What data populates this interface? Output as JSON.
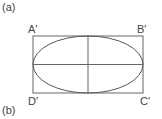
{
  "labels": {
    "panel_a": "(a)",
    "panel_b": "(b)",
    "corner_a": "A′",
    "corner_b": "B′",
    "corner_c": "C′",
    "corner_d": "D′"
  },
  "colors": {
    "stroke": "#555555",
    "text": "#444444"
  }
}
